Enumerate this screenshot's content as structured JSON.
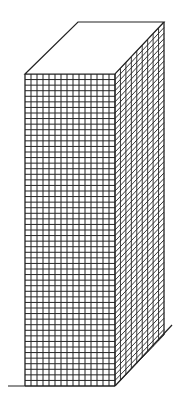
{
  "drawing": {
    "subject": "tall rectangular building with grid facade",
    "colors": {
      "line": "#222222",
      "background": "#ffffff"
    },
    "front_face": {
      "x0": 25,
      "y0": 74,
      "x1": 115,
      "y1": 386,
      "cols": 15,
      "rows": 56
    },
    "right_face": {
      "x0": 115,
      "x1": 164,
      "top_y_left": 74,
      "top_y_right": 22,
      "bottom_y_left": 386,
      "bottom_y_right": 335,
      "cols": 9,
      "rows": 56
    },
    "top_face": {
      "points": [
        [
          25,
          74
        ],
        [
          78,
          22
        ],
        [
          164,
          22
        ],
        [
          115,
          74
        ]
      ]
    },
    "ground": {
      "front_line": [
        [
          8,
          386
        ],
        [
          115,
          386
        ]
      ],
      "side_line": [
        [
          115,
          386
        ],
        [
          172,
          325
        ]
      ]
    }
  }
}
